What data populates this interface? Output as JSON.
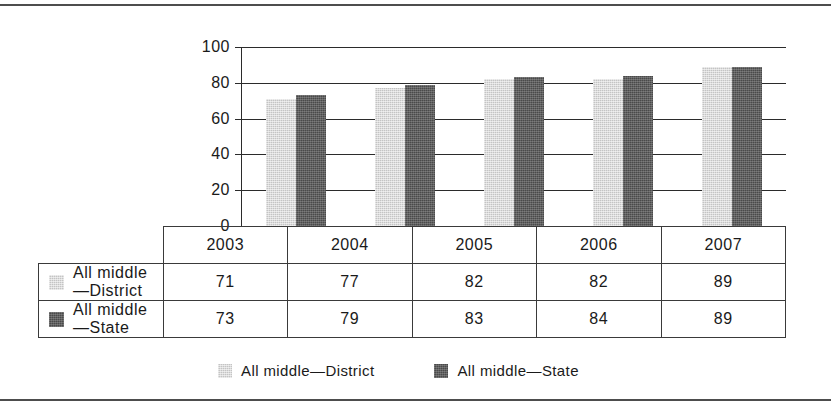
{
  "chart_data": {
    "type": "bar",
    "title": "",
    "subtitle": "",
    "xlabel": "",
    "ylabel": "",
    "categories": [
      "2003",
      "2004",
      "2005",
      "2006",
      "2007"
    ],
    "series": [
      {
        "name": "All middle—District",
        "values": [
          71,
          77,
          82,
          82,
          89
        ],
        "color": "#c4c4c4"
      },
      {
        "name": "All middle—State",
        "values": [
          73,
          79,
          83,
          84,
          89
        ],
        "color": "#4a4a4a"
      }
    ],
    "ylim": [
      0,
      100
    ],
    "yticks": [
      0,
      20,
      40,
      60,
      80,
      100
    ],
    "ytick_labels": [
      "0",
      "20",
      "40",
      "60",
      "80",
      "100"
    ],
    "grid": true,
    "legend_position": "bottom",
    "has_data_table": true
  },
  "table": {
    "header_row": [
      "",
      "2003",
      "2004",
      "2005",
      "2006",
      "2007"
    ],
    "rows": [
      {
        "label": "All middle—District",
        "swatch": "district",
        "values": [
          "71",
          "77",
          "82",
          "82",
          "89"
        ]
      },
      {
        "label": "All middle—State",
        "swatch": "state",
        "values": [
          "73",
          "79",
          "83",
          "84",
          "89"
        ]
      }
    ]
  },
  "legend": {
    "items": [
      {
        "label": "All middle—District",
        "swatch": "district"
      },
      {
        "label": "All middle—State",
        "swatch": "state"
      }
    ]
  },
  "axis": {
    "y_labels": [
      "100",
      "80",
      "60",
      "40",
      "20",
      "0"
    ]
  }
}
